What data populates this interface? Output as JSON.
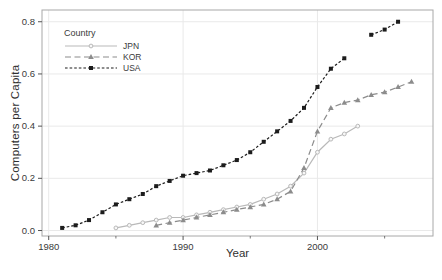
{
  "chart_data": {
    "type": "line",
    "title": "",
    "xlabel": "Year",
    "ylabel": "Computers per Capita",
    "xlim": [
      1979.5,
      2008.6
    ],
    "ylim": [
      -0.021,
      0.845
    ],
    "x_ticks": [
      1980,
      1990,
      2000
    ],
    "x_minor_ticks": [
      1985,
      1995,
      2005
    ],
    "y_ticks": [
      0.0,
      0.2,
      0.4,
      0.6,
      0.8
    ],
    "grid": true,
    "legend": {
      "title": "Country",
      "position": "top-left"
    },
    "colors": {
      "grid": "#e9e9e9",
      "panel_border": "#a8a8a8",
      "tick": "#555555",
      "tick_label": "#3a3a3a"
    },
    "series": [
      {
        "name": "JPN",
        "color": "#b9b9b9",
        "line_style": "solid",
        "marker": "circle-open",
        "x": [
          1985,
          1986,
          1987,
          1988,
          1989,
          1990,
          1991,
          1992,
          1993,
          1994,
          1995,
          1996,
          1997,
          1998,
          1999,
          2000,
          2001,
          2002,
          2003
        ],
        "values": [
          0.01,
          0.02,
          0.03,
          0.04,
          0.05,
          0.05,
          0.06,
          0.07,
          0.08,
          0.09,
          0.1,
          0.12,
          0.14,
          0.17,
          0.22,
          0.3,
          0.35,
          0.37,
          0.4
        ]
      },
      {
        "name": "KOR",
        "color": "#8c8c8c",
        "line_style": "dashed",
        "marker": "triangle",
        "x": [
          1988,
          1989,
          1990,
          1991,
          1992,
          1993,
          1994,
          1995,
          1996,
          1997,
          1998,
          1999,
          2000,
          2001,
          2002,
          2003,
          2004,
          2005,
          2006,
          2007
        ],
        "values": [
          0.02,
          0.03,
          0.04,
          0.05,
          0.06,
          0.07,
          0.08,
          0.09,
          0.1,
          0.12,
          0.15,
          0.24,
          0.38,
          0.47,
          0.49,
          0.5,
          0.52,
          0.53,
          0.55,
          0.57
        ]
      },
      {
        "name": "USA",
        "color": "#1c1c1c",
        "line_style": "dotted",
        "marker": "square",
        "x": [
          1981,
          1982,
          1983,
          1984,
          1985,
          1986,
          1987,
          1988,
          1989,
          1990,
          1991,
          1992,
          1993,
          1994,
          1995,
          1996,
          1997,
          1998,
          1999,
          2000,
          2001,
          2002,
          2004,
          2005,
          2006
        ],
        "values": [
          0.01,
          0.02,
          0.04,
          0.07,
          0.1,
          0.12,
          0.14,
          0.17,
          0.19,
          0.21,
          0.22,
          0.23,
          0.25,
          0.27,
          0.3,
          0.34,
          0.38,
          0.42,
          0.47,
          0.55,
          0.62,
          0.66,
          0.75,
          0.77,
          0.8
        ]
      }
    ]
  }
}
